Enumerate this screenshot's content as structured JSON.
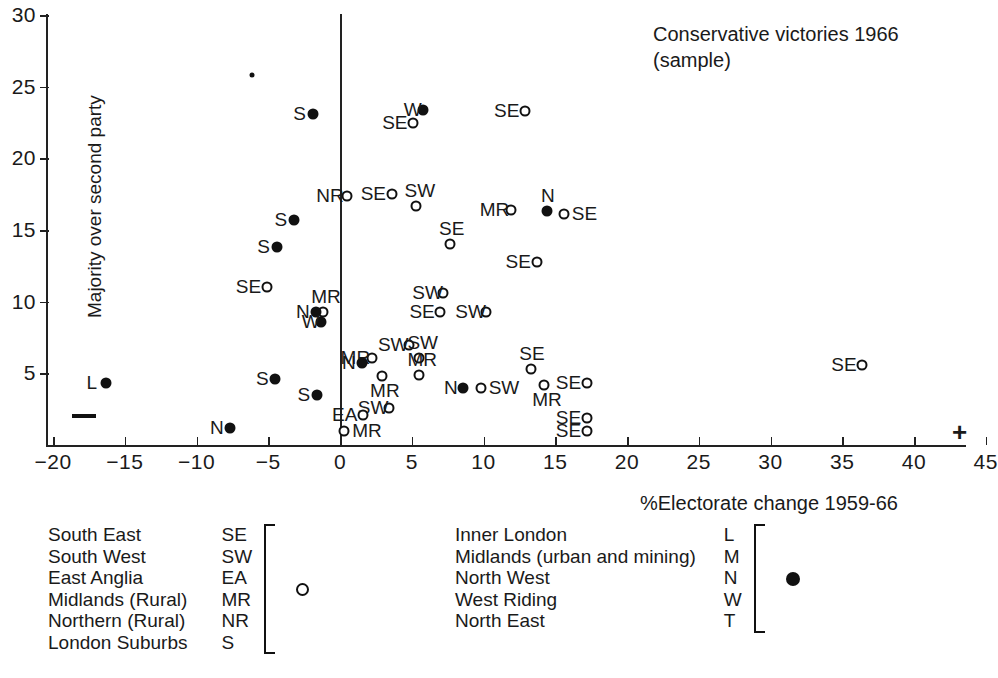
{
  "chart_data": {
    "type": "scatter",
    "title": "Conservative victories 1966\n(sample)",
    "xlabel": "%Electorate change 1959-66",
    "ylabel": "Majority over second party",
    "xlim": [
      -20,
      45
    ],
    "ylim": [
      0,
      30
    ],
    "xticks": [
      -20,
      -15,
      -10,
      -5,
      0,
      5,
      10,
      15,
      20,
      25,
      30,
      35,
      40,
      45
    ],
    "yticks": [
      5,
      10,
      15,
      20,
      25,
      30
    ],
    "grid": false,
    "legend_position": "bottom",
    "axis_markers": {
      "negative": "—",
      "positive": "+"
    },
    "series": [
      {
        "name": "open",
        "marker": "open-circle",
        "points": [
          {
            "code": "SE",
            "x": -5.1,
            "y": 11.0,
            "lab": "left"
          },
          {
            "code": "MR",
            "x": -1.2,
            "y": 9.3,
            "lab": "above"
          },
          {
            "code": "NR",
            "x": 0.5,
            "y": 17.4,
            "lab": "left"
          },
          {
            "code": "SE",
            "x": 3.6,
            "y": 17.5,
            "lab": "left"
          },
          {
            "code": "SW",
            "x": 5.3,
            "y": 16.7,
            "lab": "above"
          },
          {
            "code": "MR",
            "x": 11.9,
            "y": 16.4,
            "lab": "left"
          },
          {
            "code": "SE",
            "x": 15.6,
            "y": 16.1,
            "lab": "right"
          },
          {
            "code": "SE",
            "x": 5.1,
            "y": 22.5,
            "lab": "left"
          },
          {
            "code": "SE",
            "x": 12.9,
            "y": 23.3,
            "lab": "left"
          },
          {
            "code": "SE",
            "x": 7.7,
            "y": 14.0,
            "lab": "above"
          },
          {
            "code": "SE",
            "x": 13.7,
            "y": 12.8,
            "lab": "left"
          },
          {
            "code": "SW",
            "x": 7.2,
            "y": 10.6,
            "lab": "left"
          },
          {
            "code": "SE",
            "x": 7.0,
            "y": 9.3,
            "lab": "left"
          },
          {
            "code": "SW",
            "x": 10.2,
            "y": 9.3,
            "lab": "left"
          },
          {
            "code": "SW",
            "x": 4.8,
            "y": 7.0,
            "lab": "left"
          },
          {
            "code": "SW",
            "x": 5.5,
            "y": 6.1,
            "lab": "above"
          },
          {
            "code": "MR",
            "x": 2.2,
            "y": 6.1,
            "lab": "left"
          },
          {
            "code": "MR",
            "x": 2.9,
            "y": 4.8,
            "lab": "below"
          },
          {
            "code": "MR",
            "x": 5.5,
            "y": 4.9,
            "lab": "above"
          },
          {
            "code": "SW",
            "x": 9.8,
            "y": 4.0,
            "lab": "right"
          },
          {
            "code": "SE",
            "x": 13.3,
            "y": 5.3,
            "lab": "above"
          },
          {
            "code": "MR",
            "x": 14.2,
            "y": 4.2,
            "lab": "below"
          },
          {
            "code": "SE",
            "x": 17.2,
            "y": 4.3,
            "lab": "left"
          },
          {
            "code": "SW",
            "x": 3.4,
            "y": 2.6,
            "lab": "left"
          },
          {
            "code": "EA",
            "x": 1.6,
            "y": 2.1,
            "lab": "left"
          },
          {
            "code": "MR",
            "x": 0.3,
            "y": 1.0,
            "lab": "right"
          },
          {
            "code": "SE",
            "x": 17.2,
            "y": 1.9,
            "lab": "left"
          },
          {
            "code": "SE",
            "x": 17.2,
            "y": 1.0,
            "lab": "left"
          },
          {
            "code": "SE",
            "x": 36.4,
            "y": 5.6,
            "lab": "left"
          }
        ]
      },
      {
        "name": "filled",
        "marker": "filled-circle",
        "points": [
          {
            "code": "L",
            "x": -16.3,
            "y": 4.3,
            "lab": "left"
          },
          {
            "code": "N",
            "x": -7.7,
            "y": 1.2,
            "lab": "left"
          },
          {
            "code": "S",
            "x": -4.5,
            "y": 4.6,
            "lab": "left"
          },
          {
            "code": "S",
            "x": -1.6,
            "y": 3.5,
            "lab": "left"
          },
          {
            "code": "S",
            "x": -4.4,
            "y": 13.8,
            "lab": "left"
          },
          {
            "code": "S",
            "x": -3.2,
            "y": 15.7,
            "lab": "left"
          },
          {
            "code": "S",
            "x": -1.9,
            "y": 23.1,
            "lab": "left"
          },
          {
            "code": "N",
            "x": -1.7,
            "y": 9.3,
            "lab": "left"
          },
          {
            "code": "W",
            "x": -1.3,
            "y": 8.6,
            "lab": "left"
          },
          {
            "code": "W",
            "x": 5.8,
            "y": 23.4,
            "lab": "left"
          },
          {
            "code": "N",
            "x": 14.4,
            "y": 16.3,
            "lab": "above"
          },
          {
            "code": "N",
            "x": 1.5,
            "y": 5.7,
            "lab": "left"
          },
          {
            "code": "N",
            "x": 8.6,
            "y": 4.0,
            "lab": "left"
          },
          {
            "code": "",
            "x": -6.1,
            "y": 25.8,
            "lab": "none",
            "tiny": true
          }
        ]
      }
    ]
  },
  "legend": {
    "open_group": {
      "marker": "open-circle",
      "rows": [
        {
          "name": "South East",
          "code": "SE"
        },
        {
          "name": "South West",
          "code": "SW"
        },
        {
          "name": "East Anglia",
          "code": "EA"
        },
        {
          "name": "Midlands (Rural)",
          "code": "MR"
        },
        {
          "name": "Northern (Rural)",
          "code": "NR"
        },
        {
          "name": "London Suburbs",
          "code": "S"
        }
      ]
    },
    "filled_group": {
      "marker": "filled-circle",
      "rows": [
        {
          "name": "Inner London",
          "code": "L"
        },
        {
          "name": "Midlands (urban and mining)",
          "code": "M"
        },
        {
          "name": "North West",
          "code": "N"
        },
        {
          "name": "West Riding",
          "code": "W"
        },
        {
          "name": "North East",
          "code": "T"
        }
      ]
    }
  },
  "colors": {
    "ink": "#111111",
    "background": "#ffffff"
  }
}
